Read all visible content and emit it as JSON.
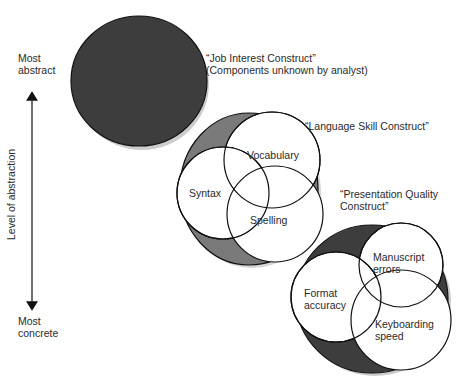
{
  "axis": {
    "top_label_line1": "Most",
    "top_label_line2": "abstract",
    "bottom_label_line1": "Most",
    "bottom_label_line2": "concrete",
    "title": "Level of abstraction"
  },
  "constructs": [
    {
      "title_line1": "“Job Interest Construct”",
      "title_line2": "(Components unknown by analyst)",
      "fill": "#3d3d3d",
      "components": []
    },
    {
      "title_line1": "“Language Skill Construct”",
      "fill": "#7a7a7a",
      "components": [
        "Vocabulary",
        "Syntax",
        "Spelling"
      ]
    },
    {
      "title_line1": "“Presentation Quality",
      "title_line2": "Construct”",
      "fill": "#3d3d3d",
      "components": [
        {
          "line1": "Manuscript",
          "line2": "errors"
        },
        {
          "line1": "Format",
          "line2": "accuracy"
        },
        {
          "line1": "Keyboarding",
          "line2": "speed"
        }
      ]
    }
  ],
  "colors": {
    "dark_fill": "#3d3d3d",
    "medium_fill": "#7a7a7a",
    "stroke": "#111111",
    "inner_fill": "#ffffff"
  }
}
